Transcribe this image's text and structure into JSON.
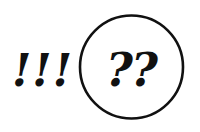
{
  "figure": {
    "exclamations": "!!!",
    "questions": "??",
    "colors": {
      "ink": "#111111",
      "background": "#ffffff"
    }
  }
}
